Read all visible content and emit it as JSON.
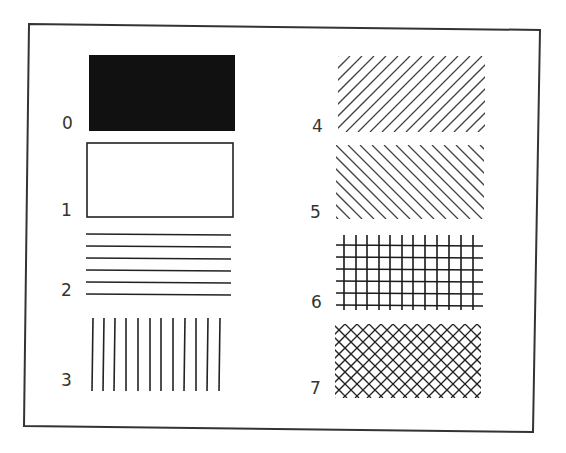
{
  "figure": {
    "frame_color": "#333333",
    "ink_color": "#1a1a1a"
  },
  "patterns": [
    {
      "index": "0",
      "name": "solid fill"
    },
    {
      "index": "1",
      "name": "hollow (no fill)"
    },
    {
      "index": "2",
      "name": "horizontal lines"
    },
    {
      "index": "3",
      "name": "vertical lines"
    },
    {
      "index": "4",
      "name": "forward diagonal lines (/)"
    },
    {
      "index": "5",
      "name": "backward diagonal lines (\\)"
    },
    {
      "index": "6",
      "name": "square crosshatch"
    },
    {
      "index": "7",
      "name": "diagonal crosshatch"
    }
  ]
}
